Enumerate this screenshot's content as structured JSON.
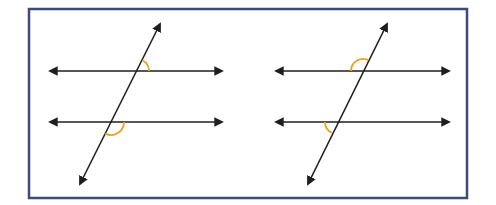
{
  "diagram": {
    "frame": {
      "x": 29,
      "y": 9,
      "width": 438,
      "height": 189,
      "stroke": "#3d4a7a"
    },
    "line_color": "#1e1e1e",
    "arc_color": "#f0a020",
    "figures": [
      {
        "name": "left-figure",
        "parallel_lines": [
          {
            "x1": 50,
            "x2": 222,
            "y": 71
          },
          {
            "x1": 50,
            "x2": 222,
            "y": 122
          }
        ],
        "transversal": {
          "x1": 160,
          "y1": 24,
          "x2": 80,
          "y2": 184
        },
        "angle_marks": [
          {
            "cx": 137,
            "cy": 71,
            "r": 12,
            "position": "upper-right of top intersection"
          },
          {
            "cx": 111,
            "cy": 122,
            "r": 13,
            "position": "lower-right of bottom intersection"
          }
        ]
      },
      {
        "name": "right-figure",
        "parallel_lines": [
          {
            "x1": 276,
            "x2": 449,
            "y": 71
          },
          {
            "x1": 276,
            "x2": 449,
            "y": 122
          }
        ],
        "transversal": {
          "x1": 387,
          "y1": 24,
          "x2": 308,
          "y2": 184
        },
        "angle_marks": [
          {
            "cx": 363,
            "cy": 71,
            "r": 12,
            "position": "upper-left of top intersection"
          },
          {
            "cx": 337,
            "cy": 122,
            "r": 12,
            "position": "lower-left of bottom intersection"
          }
        ]
      }
    ]
  }
}
